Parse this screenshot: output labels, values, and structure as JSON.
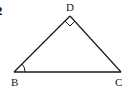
{
  "figure": {
    "problem_number": "2",
    "shape": "triangle",
    "vertices": [
      {
        "label": "D",
        "x": 70,
        "y": 16
      },
      {
        "label": "B",
        "x": 14,
        "y": 72
      },
      {
        "label": "C",
        "x": 121,
        "y": 72
      }
    ],
    "right_angle_at": "D",
    "angle_marked_at": "B",
    "stroke_color": "#1a1a1a",
    "background_color": "#ffffff"
  }
}
